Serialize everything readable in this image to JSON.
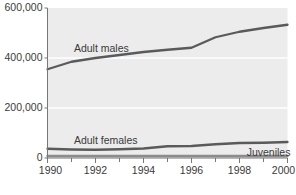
{
  "chart_data": {
    "type": "line",
    "title": "",
    "subtitle": "",
    "xlabel": "",
    "ylabel": "",
    "xlim": [
      1990,
      2000
    ],
    "ylim": [
      0,
      600000
    ],
    "grid": true,
    "gridlines_y": [
      200000,
      400000,
      600000
    ],
    "legend_position": "inline-annotations",
    "x": [
      1990,
      1991,
      1992,
      1993,
      1994,
      1995,
      1996,
      1997,
      1998,
      1999,
      2000
    ],
    "yticks": [
      "0",
      "200,000",
      "400,000",
      "600,000"
    ],
    "ytick_values": [
      0,
      200000,
      400000,
      600000
    ],
    "xticks": [
      "1990",
      "1992",
      "1994",
      "1996",
      "1998",
      "2000"
    ],
    "xtick_values": [
      1990,
      1992,
      1994,
      1996,
      1998,
      2000
    ],
    "xminor_ticks": [
      1991,
      1993,
      1995,
      1997,
      1999
    ],
    "series": [
      {
        "name": "Adult males",
        "color": "#5a5a5a",
        "values": [
          355000,
          385000,
          400000,
          412000,
          424000,
          433000,
          441000,
          483000,
          505000,
          520000,
          533000
        ],
        "label_x": 1991.1,
        "label_y": 437000
      },
      {
        "name": "Adult females",
        "color": "#5a5a5a",
        "values": [
          37000,
          34000,
          33000,
          35000,
          38000,
          47000,
          48000,
          55000,
          60000,
          61000,
          64000
        ],
        "label_x": 1991.1,
        "label_y": 68000
      },
      {
        "name": "Juveniles",
        "color": "#8c8c8c",
        "values": [
          8000,
          8000,
          8000,
          8000,
          8000,
          8000,
          8000,
          8000,
          8000,
          8000,
          8000
        ],
        "label_x": 1998.3,
        "label_y": 22000
      }
    ],
    "plot_background": "#ececec",
    "gridline_color": "#ffffff",
    "axis_color": "#777777",
    "text_color": "#3a3a3a"
  },
  "caption": {
    "text": ""
  }
}
